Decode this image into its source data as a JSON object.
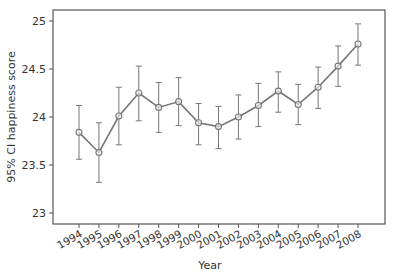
{
  "chart_data": {
    "type": "line",
    "title": "",
    "xlabel": "Year",
    "ylabel": "95% CI happiness score",
    "ylim": [
      22.92,
      25.11
    ],
    "yticks": [
      23,
      23.5,
      24,
      24.5,
      25
    ],
    "ytick_labels": [
      "23",
      "23.5",
      "24",
      "24.5",
      "25"
    ],
    "grid": false,
    "legend": null,
    "categories": [
      "1994",
      "1995",
      "1996",
      "1997",
      "1998",
      "1999",
      "2000",
      "2001",
      "2002",
      "2003",
      "2004",
      "2005",
      "2006",
      "2007",
      "2008"
    ],
    "series": [
      {
        "name": "Mean happiness score",
        "values": [
          23.84,
          23.63,
          24.01,
          24.25,
          24.1,
          24.16,
          23.94,
          23.9,
          24.0,
          24.12,
          24.27,
          24.13,
          24.31,
          24.53,
          24.76
        ],
        "ci_upper": [
          24.12,
          23.94,
          24.31,
          24.53,
          24.36,
          24.41,
          24.14,
          24.11,
          24.23,
          24.35,
          24.47,
          24.34,
          24.52,
          24.74,
          24.97
        ],
        "ci_lower": [
          23.56,
          23.32,
          23.71,
          23.96,
          23.84,
          23.91,
          23.71,
          23.67,
          23.77,
          23.9,
          24.05,
          23.92,
          24.09,
          24.32,
          24.54
        ],
        "marker": "hollow-circle",
        "color": "#777777"
      }
    ]
  },
  "style": {
    "line_color": "#777777",
    "axis_color": "#555555",
    "text_color": "#333333"
  }
}
